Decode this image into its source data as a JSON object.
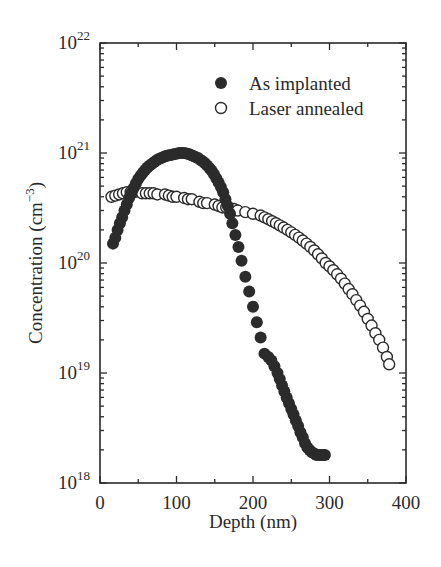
{
  "chart_data": {
    "type": "scatter",
    "title": "",
    "xlabel": "Depth (nm)",
    "ylabel": "Concentration (cm⁻³)",
    "ylabel_base": "Concentration (cm",
    "ylabel_exp": "−3",
    "ylabel_close": ")",
    "xlim": [
      0,
      400
    ],
    "ylim": [
      1e+18,
      1e+22
    ],
    "yscale": "log",
    "grid": false,
    "legend_position": "upper right",
    "x_ticks": [
      0,
      100,
      200,
      300,
      400
    ],
    "x_tick_labels": [
      "0",
      "100",
      "200",
      "300",
      "400"
    ],
    "y_ticks": [
      1e+18,
      1e+19,
      1e+20,
      1e+21,
      1e+22
    ],
    "y_tick_labels": [
      {
        "base": "10",
        "exp": "18"
      },
      {
        "base": "10",
        "exp": "19"
      },
      {
        "base": "10",
        "exp": "20"
      },
      {
        "base": "10",
        "exp": "21"
      },
      {
        "base": "10",
        "exp": "22"
      }
    ],
    "series": [
      {
        "name": "As implanted",
        "marker": "filled-circle",
        "color": "#2b2b2b",
        "x": [
          17,
          20,
          23,
          26,
          29,
          32,
          35,
          38,
          41,
          44,
          47,
          50,
          53,
          56,
          59,
          62,
          65,
          68,
          71,
          74,
          77,
          80,
          83,
          86,
          89,
          92,
          95,
          98,
          101,
          104,
          107,
          110,
          113,
          116,
          119,
          122,
          125,
          128,
          131,
          134,
          137,
          140,
          143,
          146,
          149,
          152,
          155,
          158,
          161,
          164,
          167,
          170,
          173,
          177,
          181,
          185,
          190,
          195,
          200,
          205,
          210,
          215,
          220,
          224,
          228,
          232,
          235,
          238,
          241,
          244,
          247,
          250,
          253,
          256,
          259,
          262,
          265,
          268,
          271,
          274,
          277,
          280,
          283,
          286,
          289,
          292,
          294
        ],
        "y": [
          1.5e+20,
          1.7e+20,
          2e+20,
          2.3e+20,
          2.6e+20,
          3e+20,
          3.4e+20,
          3.9e+20,
          4.3e+20,
          4.8e+20,
          5.3e+20,
          5.8e+20,
          6.2e+20,
          6.6e+20,
          7e+20,
          7.4e+20,
          7.7e+20,
          8e+20,
          8.3e+20,
          8.6e+20,
          8.8e+20,
          9e+20,
          9.2e+20,
          9.4e+20,
          9.5e+20,
          9.6e+20,
          9.7e+20,
          9.8e+20,
          9.9e+20,
          1e+21,
          1e+21,
          1e+21,
          9.9e+20,
          9.8e+20,
          9.6e+20,
          9.4e+20,
          9.2e+20,
          9e+20,
          8.7e+20,
          8.4e+20,
          8.1e+20,
          7.7e+20,
          7.3e+20,
          6.9e+20,
          6.4e+20,
          5.9e+20,
          5.4e+20,
          4.9e+20,
          4.4e+20,
          3.8e+20,
          3.3e+20,
          2.8e+20,
          2.3e+20,
          1.8e+20,
          1.4e+20,
          1.05e+20,
          7.5e+19,
          5.5e+19,
          4e+19,
          2.9e+19,
          2.1e+19,
          1.5e+19,
          1.4e+19,
          1.3e+19,
          1.15e+19,
          1e+19,
          8.8e+18,
          7.7e+18,
          6.8e+18,
          6e+18,
          5.3e+18,
          4.7e+18,
          4.2e+18,
          3.7e+18,
          3.3e+18,
          2.9e+18,
          2.6e+18,
          2.3e+18,
          2.1e+18,
          2e+18,
          1.9e+18,
          1.85e+18,
          1.8e+18,
          1.8e+18,
          1.8e+18,
          1.8e+18,
          1.8e+18
        ]
      },
      {
        "name": "Laser annealed",
        "marker": "open-circle",
        "color": "#2b2b2b",
        "x": [
          15,
          20,
          25,
          30,
          35,
          40,
          45,
          55,
          60,
          65,
          70,
          75,
          85,
          90,
          95,
          100,
          110,
          115,
          120,
          130,
          135,
          140,
          150,
          155,
          160,
          165,
          170,
          175,
          180,
          190,
          200,
          210,
          215,
          220,
          225,
          230,
          235,
          240,
          245,
          250,
          255,
          260,
          265,
          270,
          275,
          280,
          285,
          290,
          295,
          300,
          305,
          310,
          315,
          320,
          325,
          330,
          335,
          340,
          345,
          350,
          355,
          360,
          365,
          370,
          375,
          378
        ],
        "y": [
          4e+20,
          4.1e+20,
          4.2e+20,
          4.3e+20,
          4.4e+20,
          4.4e+20,
          4.4e+20,
          4.3e+20,
          4.3e+20,
          4.3e+20,
          4.3e+20,
          4.2e+20,
          4.2e+20,
          4.1e+20,
          4e+20,
          4e+20,
          3.9e+20,
          3.8e+20,
          3.8e+20,
          3.6e+20,
          3.5e+20,
          3.5e+20,
          3.4e+20,
          3.3e+20,
          3.2e+20,
          3.2e+20,
          3.1e+20,
          3.1e+20,
          3e+20,
          2.9e+20,
          2.8e+20,
          2.7e+20,
          2.6e+20,
          2.5e+20,
          2.4e+20,
          2.3e+20,
          2.2e+20,
          2.1e+20,
          2e+20,
          1.9e+20,
          1.8e+20,
          1.7e+20,
          1.6e+20,
          1.5e+20,
          1.4e+20,
          1.3e+20,
          1.2e+20,
          1.1e+20,
          1e+20,
          9.3e+19,
          8.6e+19,
          7.9e+19,
          7.2e+19,
          6.5e+19,
          5.8e+19,
          5.2e+19,
          4.6e+19,
          4.1e+19,
          3.6e+19,
          3.1e+19,
          2.7e+19,
          2.3e+19,
          2e+19,
          1.7e+19,
          1.4e+19,
          1.2e+19
        ]
      }
    ]
  },
  "legend": {
    "items": [
      {
        "label": "As implanted",
        "marker": "filled-circle"
      },
      {
        "label": "Laser annealed",
        "marker": "open-circle"
      }
    ]
  },
  "layout": {
    "plot_left": 100,
    "plot_right": 406,
    "plot_top": 43,
    "plot_bottom": 483
  }
}
